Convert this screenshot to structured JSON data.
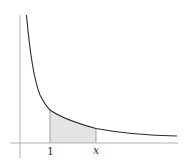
{
  "diagram": {
    "title": "",
    "function": "y = 1/x",
    "shaded_region": {
      "from": "1",
      "to": "x"
    },
    "labels": {
      "lower_bound": "1",
      "upper_bound": "x"
    },
    "colors": {
      "curve": "#2a2a2a",
      "axes": "#9a9a9a",
      "shade": "#e4e4e4",
      "shade_edge": "#8a8a8a"
    }
  }
}
